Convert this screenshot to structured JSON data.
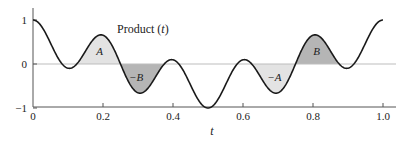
{
  "chart_data": {
    "type": "line",
    "title": "",
    "series_label": "Product (t)",
    "function": "cos(6*pi*t) * cos(4*pi*t)",
    "xlabel": "t",
    "ylabel": "",
    "xlim": [
      0,
      1.0
    ],
    "ylim": [
      -1,
      1
    ],
    "x_ticks": [
      0,
      0.2,
      0.4,
      0.6,
      0.8,
      1.0
    ],
    "x_tick_labels": [
      "0",
      "0.2",
      "0.4",
      "0.6",
      "0.8",
      "1.0"
    ],
    "y_ticks": [
      -1,
      0,
      1
    ],
    "y_tick_labels": [
      "−1",
      "0",
      "1"
    ],
    "grid": false,
    "zero_line": true,
    "x": [
      0,
      0.05,
      0.1,
      0.15,
      0.2,
      0.25,
      0.3,
      0.35,
      0.4,
      0.45,
      0.5,
      0.55,
      0.6,
      0.65,
      0.7,
      0.75,
      0.8,
      0.85,
      0.9,
      0.95,
      1.0
    ],
    "values": [
      1.0,
      0.41,
      -0.1,
      0.29,
      0.65,
      0.0,
      -0.65,
      -0.29,
      0.1,
      -0.41,
      -1.0,
      -0.41,
      0.1,
      -0.29,
      -0.65,
      0.0,
      0.65,
      0.29,
      -0.1,
      0.41,
      1.0
    ],
    "shaded_regions": [
      {
        "label": "A",
        "t_start": 0.125,
        "t_end": 0.25,
        "fill": "#e3e3e3",
        "label_t": 0.19,
        "label_y": 0.3
      },
      {
        "label": "−B",
        "t_start": 0.25,
        "t_end": 0.375,
        "fill": "#b5b5b5",
        "label_t": 0.295,
        "label_y": -0.3
      },
      {
        "label": "−A",
        "t_start": 0.625,
        "t_end": 0.75,
        "fill": "#e3e3e3",
        "label_t": 0.69,
        "label_y": -0.3
      },
      {
        "label": "B",
        "t_start": 0.75,
        "t_end": 0.875,
        "fill": "#b5b5b5",
        "label_t": 0.81,
        "label_y": 0.3
      }
    ],
    "colors": {
      "curve": "#1a1a1a",
      "axis": "#555555",
      "zero_line": "#bdbdbd"
    }
  }
}
